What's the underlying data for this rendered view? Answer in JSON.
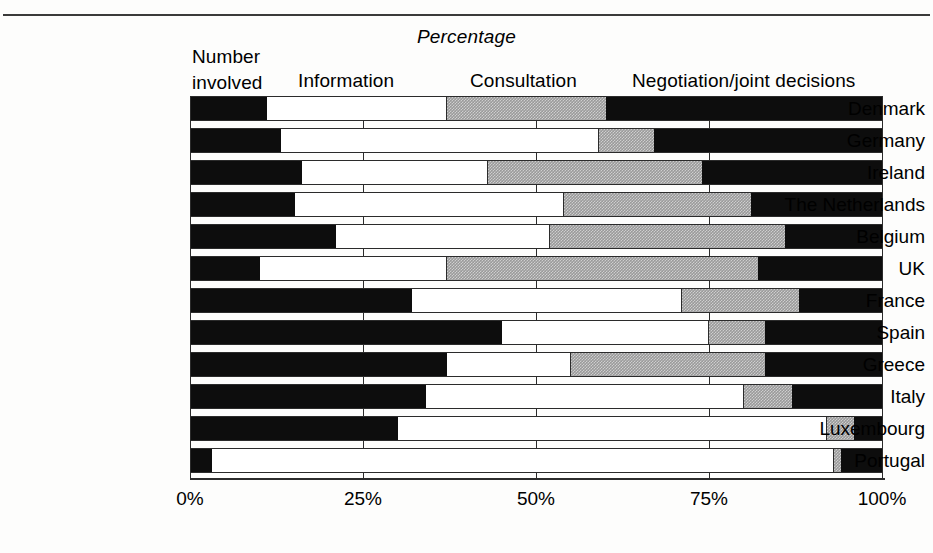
{
  "figure": {
    "title": "Percentage",
    "column_headers": [
      {
        "id": "number-involved",
        "line1": "Number",
        "line2": "involved"
      },
      {
        "id": "information",
        "label": "Information"
      },
      {
        "id": "consultation",
        "label": "Consultation"
      },
      {
        "id": "negotiation",
        "label": "Negotiation/joint decisions"
      }
    ],
    "axis": {
      "ticks": [
        "0%",
        "25%",
        "50%",
        "75%",
        "100%"
      ],
      "tick_values": [
        0,
        25,
        50,
        75,
        100
      ]
    },
    "colors": {
      "number_involved": "#0d0d0d",
      "information": "#ffffff",
      "consultation": "#9a9a9a",
      "negotiation": "#0d0d0d",
      "axis": "#2b2b2b",
      "background": "#fdfdfc"
    }
  },
  "chart_data": {
    "type": "bar",
    "orientation": "horizontal",
    "stacked": true,
    "normalized_percent": true,
    "title": "Percentage",
    "xlabel": "Percentage",
    "ylabel": "",
    "xlim": [
      0,
      100
    ],
    "grid": true,
    "legend_position": "top",
    "xticks": [
      0,
      25,
      50,
      75,
      100
    ],
    "xticklabels": [
      "0%",
      "25%",
      "50%",
      "75%",
      "100%"
    ],
    "categories": [
      "Denmark",
      "Germany",
      "Ireland",
      "The Netherlands",
      "Belgium",
      "UK",
      "France",
      "Spain",
      "Greece",
      "Italy",
      "Luxembourg",
      "Portugal"
    ],
    "series": [
      {
        "name": "Number involved",
        "color": "#0d0d0d",
        "values": [
          11,
          13,
          16,
          15,
          21,
          10,
          32,
          45,
          37,
          34,
          30,
          3
        ]
      },
      {
        "name": "Information",
        "color": "#ffffff",
        "values": [
          26,
          46,
          27,
          39,
          31,
          27,
          39,
          30,
          18,
          46,
          62,
          90
        ]
      },
      {
        "name": "Consultation",
        "color": "#9a9a9a",
        "values": [
          23,
          8,
          31,
          27,
          34,
          45,
          17,
          8,
          28,
          7,
          4,
          1
        ]
      },
      {
        "name": "Negotiation/joint decisions",
        "color": "#0d0d0d",
        "values": [
          40,
          33,
          26,
          19,
          14,
          18,
          12,
          17,
          17,
          13,
          4,
          6
        ]
      }
    ]
  }
}
